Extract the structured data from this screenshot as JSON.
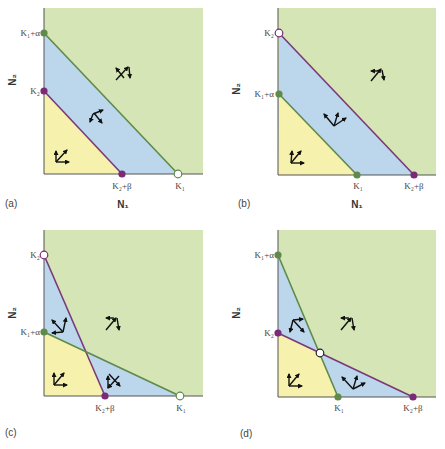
{
  "colors": {
    "green_region": "#d6e5b5",
    "blue_region": "#bcd6ec",
    "yellow_region": "#f6f1ad",
    "species1_line": "#5f8a4a",
    "species2_line": "#7a3a78",
    "species1_dot": "#5f8a4a",
    "species2_dot": "#7a2a76",
    "axis": "#555555"
  },
  "axis_labels": {
    "x": "N₁",
    "y": "N₂"
  },
  "panels": [
    {
      "id": "a",
      "label": "(a)",
      "y_ticks": [
        "K₁+α",
        "K₂"
      ],
      "x_ticks": [
        "K₂+β",
        "K₁"
      ],
      "show_x_axis_label": true,
      "show_y_axis_label": true
    },
    {
      "id": "b",
      "label": "(b)",
      "y_ticks": [
        "K₂",
        "K₁+α"
      ],
      "x_ticks": [
        "K₁",
        "K₂+β"
      ],
      "show_x_axis_label": true,
      "show_y_axis_label": true
    },
    {
      "id": "c",
      "label": "(c)",
      "y_ticks": [
        "K₂",
        "K₁+α"
      ],
      "x_ticks": [
        "K₂+β",
        "K₁"
      ],
      "show_x_axis_label": false,
      "show_y_axis_label": true
    },
    {
      "id": "d",
      "label": "(d)",
      "y_ticks": [
        "K₁+α",
        "K₂"
      ],
      "x_ticks": [
        "K₁",
        "K₂+β"
      ],
      "show_x_axis_label": false,
      "show_y_axis_label": true
    }
  ]
}
